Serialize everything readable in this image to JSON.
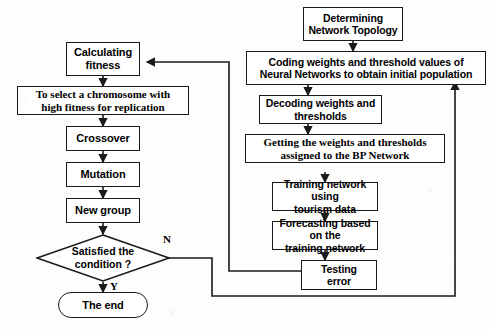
{
  "diagram": {
    "type": "flowchart",
    "colors": {
      "stroke": "#1a1a1a",
      "fill": "#ffffff",
      "background": "#fdfdfc",
      "text": "#000000"
    },
    "left_branch": {
      "name": "Genetic Algorithm loop",
      "nodes": [
        {
          "id": "calculating-fitness",
          "label": "Calculating\nfitness",
          "shape": "process"
        },
        {
          "id": "select-chromosome",
          "label": "To select a chromosome with\nhigh fitness for replication",
          "shape": "process"
        },
        {
          "id": "crossover",
          "label": "Crossover",
          "shape": "process"
        },
        {
          "id": "mutation",
          "label": "Mutation",
          "shape": "process"
        },
        {
          "id": "new-group",
          "label": "New group",
          "shape": "process"
        },
        {
          "id": "satisfied-condition",
          "label": "Satisfied the\ncondition ?",
          "shape": "decision"
        },
        {
          "id": "the-end",
          "label": "The end",
          "shape": "terminator"
        }
      ]
    },
    "right_branch": {
      "name": "BP Neural Network pipeline",
      "nodes": [
        {
          "id": "determining-topology",
          "label": "Determining\nNetwork Topology",
          "shape": "process"
        },
        {
          "id": "coding-weights",
          "label": "Coding weights and threshold values of\nNeural Networks to obtain initial population",
          "shape": "process"
        },
        {
          "id": "decoding-weights",
          "label": "Decoding weights and\nthresholds",
          "shape": "process"
        },
        {
          "id": "getting-weights",
          "label": "Getting the weights and thresholds\nassigned to the BP Network",
          "shape": "process"
        },
        {
          "id": "training-network",
          "label": "Training network using\ntourism data",
          "shape": "process"
        },
        {
          "id": "forecasting",
          "label": "Forecasting based on the\ntraining network",
          "shape": "process"
        },
        {
          "id": "testing-error",
          "label": "Testing\nerror",
          "shape": "process"
        }
      ]
    },
    "edge_labels": [
      {
        "id": "branch-no",
        "label": "N",
        "from": "satisfied-condition",
        "meaning": "no"
      },
      {
        "id": "branch-yes",
        "label": "Y",
        "from": "satisfied-condition",
        "meaning": "yes"
      }
    ],
    "connections": [
      {
        "from": "calculating-fitness",
        "to": "select-chromosome"
      },
      {
        "from": "select-chromosome",
        "to": "crossover"
      },
      {
        "from": "crossover",
        "to": "mutation"
      },
      {
        "from": "mutation",
        "to": "new-group"
      },
      {
        "from": "new-group",
        "to": "satisfied-condition"
      },
      {
        "from": "satisfied-condition",
        "to": "the-end",
        "label": "Y"
      },
      {
        "from": "satisfied-condition",
        "to": "coding-weights",
        "label": "N"
      },
      {
        "from": "determining-topology",
        "to": "coding-weights"
      },
      {
        "from": "coding-weights",
        "to": "decoding-weights"
      },
      {
        "from": "decoding-weights",
        "to": "getting-weights"
      },
      {
        "from": "getting-weights",
        "to": "training-network"
      },
      {
        "from": "training-network",
        "to": "forecasting"
      },
      {
        "from": "forecasting",
        "to": "testing-error"
      },
      {
        "from": "testing-error",
        "to": "calculating-fitness"
      }
    ]
  }
}
